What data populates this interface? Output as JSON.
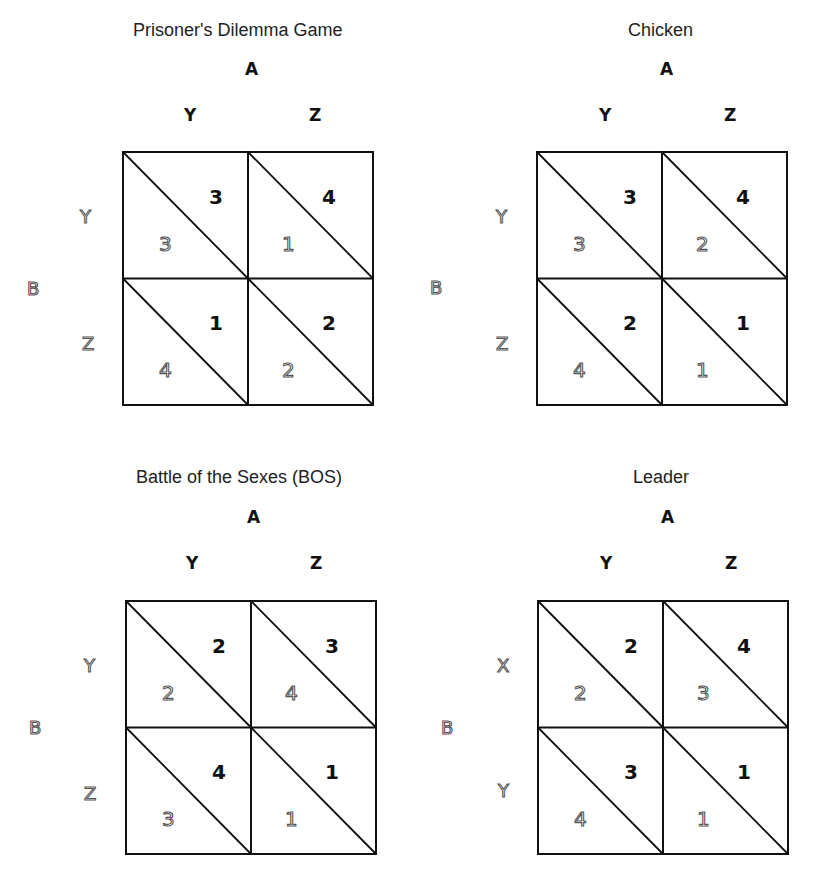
{
  "games": [
    {
      "title": "Prisoner's Dilemma Game",
      "column_player": "A",
      "row_player": "B",
      "columns": [
        "Y",
        "Z"
      ],
      "rows": [
        "Y",
        "Z"
      ],
      "cells": [
        [
          {
            "a": "3",
            "b": "3"
          },
          {
            "a": "4",
            "b": "1"
          }
        ],
        [
          {
            "a": "1",
            "b": "4"
          },
          {
            "a": "2",
            "b": "2"
          }
        ]
      ]
    },
    {
      "title": "Chicken",
      "column_player": "A",
      "row_player": "B",
      "columns": [
        "Y",
        "Z"
      ],
      "rows": [
        "Y",
        "Z"
      ],
      "cells": [
        [
          {
            "a": "3",
            "b": "3"
          },
          {
            "a": "4",
            "b": "2"
          }
        ],
        [
          {
            "a": "2",
            "b": "4"
          },
          {
            "a": "1",
            "b": "1"
          }
        ]
      ]
    },
    {
      "title": "Battle of the Sexes (BOS)",
      "column_player": "A",
      "row_player": "B",
      "columns": [
        "Y",
        "Z"
      ],
      "rows": [
        "Y",
        "Z"
      ],
      "cells": [
        [
          {
            "a": "2",
            "b": "2"
          },
          {
            "a": "3",
            "b": "4"
          }
        ],
        [
          {
            "a": "4",
            "b": "3"
          },
          {
            "a": "1",
            "b": "1"
          }
        ]
      ]
    },
    {
      "title": "Leader",
      "column_player": "A",
      "row_player": "B",
      "columns": [
        "Y",
        "Z"
      ],
      "rows": [
        "X",
        "Y"
      ],
      "cells": [
        [
          {
            "a": "2",
            "b": "2"
          },
          {
            "a": "4",
            "b": "3"
          }
        ],
        [
          {
            "a": "3",
            "b": "4"
          },
          {
            "a": "1",
            "b": "1"
          }
        ]
      ]
    }
  ],
  "legend": {
    "bold_upper_right": "payoff to player A (column)",
    "outline_lower_left": "payoff to player B (row)"
  },
  "colors": {
    "line": "#111111",
    "text": "#111111",
    "outline_text": "#555555",
    "background": "#ffffff"
  }
}
